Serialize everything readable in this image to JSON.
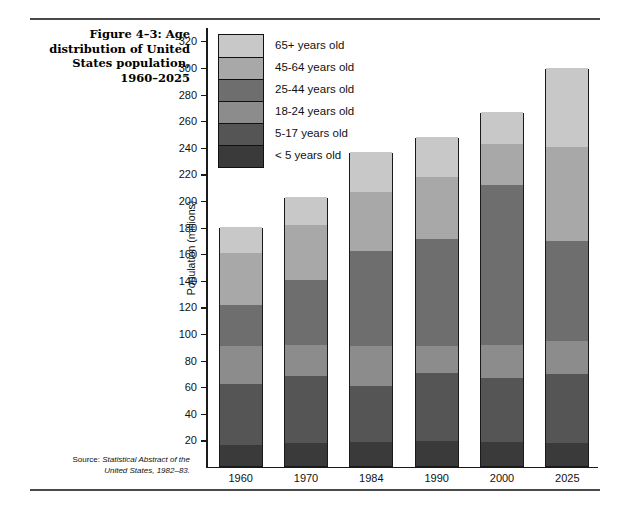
{
  "figure": {
    "title_lines": [
      "Figure 4–3: Age",
      "distribution of United",
      "States population,",
      "1960–2025"
    ],
    "source_label": "Source:",
    "source_title_line1": "Statistical Abstract of the",
    "source_title_line2": "United States, 1982–83."
  },
  "chart_data": {
    "type": "bar",
    "subtype": "stacked-vertical",
    "title": "Figure 4–3: Age distribution of United States population, 1960–2025",
    "xlabel": "",
    "ylabel": "Population (millions)",
    "categories": [
      "1960",
      "1970",
      "1984",
      "1990",
      "2000",
      "2025"
    ],
    "ylim": [
      0,
      330
    ],
    "yticks": [
      20,
      40,
      60,
      80,
      100,
      120,
      140,
      160,
      180,
      200,
      220,
      240,
      260,
      280,
      300,
      320
    ],
    "ytick_labels": [
      "20",
      "40",
      "60",
      "80",
      "100",
      "120",
      "140",
      "160",
      "180",
      "200",
      "220",
      "240",
      "260",
      "280",
      "300",
      "320"
    ],
    "grid": false,
    "legend_position": "upper-left-inside",
    "stack_order_bottom_to_top": [
      "< 5 years old",
      "5-17 years old",
      "18-24 years old",
      "25-44 years old",
      "45-64 years old",
      "65+ years old"
    ],
    "series": [
      {
        "name": "< 5 years old",
        "color": "#3a3a3a",
        "values": [
          16,
          17,
          18,
          19,
          18,
          17
        ]
      },
      {
        "name": "5-17 years old",
        "color": "#555555",
        "values": [
          46,
          51,
          42,
          51,
          48,
          52
        ]
      },
      {
        "name": "18-24 years old",
        "color": "#8c8c8c",
        "values": [
          28,
          23,
          30,
          20,
          25,
          25
        ]
      },
      {
        "name": "25-44 years old",
        "color": "#6e6e6e",
        "values": [
          31,
          49,
          72,
          81,
          120,
          75
        ]
      },
      {
        "name": "45-64 years old",
        "color": "#a8a8a8",
        "values": [
          39,
          41,
          44,
          46,
          31,
          71
        ]
      },
      {
        "name": "65+ years old",
        "color": "#c8c8c8",
        "values": [
          20,
          21,
          30,
          30,
          24,
          59
        ]
      }
    ],
    "totals": [
      180,
      202,
      236,
      247,
      266,
      299
    ],
    "cumulative_tops": [
      [
        16,
        62,
        90,
        121,
        160,
        180
      ],
      [
        17,
        68,
        91,
        140,
        181,
        202
      ],
      [
        18,
        60,
        90,
        162,
        206,
        236
      ],
      [
        19,
        70,
        90,
        171,
        217,
        247
      ],
      [
        18,
        66,
        91,
        211,
        242,
        266
      ],
      [
        17,
        69,
        94,
        169,
        240,
        299
      ]
    ]
  },
  "legend": {
    "items": [
      {
        "label": "65+ years old",
        "color": "#c8c8c8"
      },
      {
        "label": "45-64 years old",
        "color": "#a8a8a8"
      },
      {
        "label": "25-44 years old",
        "color": "#6e6e6e"
      },
      {
        "label": "18-24 years old",
        "color": "#8c8c8c"
      },
      {
        "label": "5-17 years old",
        "color": "#555555"
      },
      {
        "label": "< 5 years old",
        "color": "#3a3a3a"
      }
    ]
  }
}
